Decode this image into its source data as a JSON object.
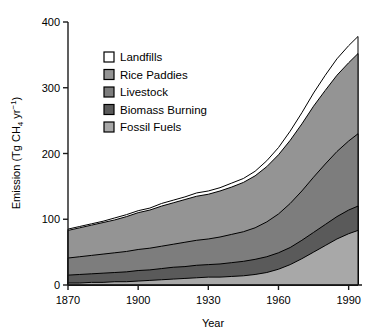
{
  "chart_data": {
    "type": "area",
    "stacked": true,
    "title": "",
    "xlabel": "Year",
    "ylabel": "Emission (Tg CH4 yr-1)",
    "ylabel_display": "Emission (Tg CH₄ yr⁻¹)",
    "xlim": [
      1870,
      1994
    ],
    "ylim": [
      0,
      400
    ],
    "xticks": [
      1870,
      1900,
      1930,
      1960,
      1990
    ],
    "yticks": [
      0,
      100,
      200,
      300,
      400
    ],
    "grid": false,
    "legend_position": "upper-left-inside",
    "x": [
      1870,
      1875,
      1880,
      1885,
      1890,
      1895,
      1900,
      1905,
      1910,
      1915,
      1920,
      1925,
      1930,
      1935,
      1940,
      1945,
      1950,
      1955,
      1960,
      1965,
      1970,
      1975,
      1980,
      1985,
      1990,
      1994
    ],
    "series": [
      {
        "name": "Fossil Fuels",
        "color": "#a8a8a8",
        "values": [
          3,
          3,
          4,
          4,
          5,
          5,
          6,
          7,
          8,
          9,
          10,
          11,
          12,
          12,
          13,
          14,
          16,
          19,
          24,
          31,
          40,
          50,
          60,
          70,
          78,
          83
        ]
      },
      {
        "name": "Biomass Burning",
        "color": "#5a5a5a",
        "values": [
          12,
          13,
          13,
          14,
          14,
          15,
          16,
          16,
          17,
          18,
          18,
          19,
          19,
          20,
          21,
          22,
          23,
          24,
          25,
          26,
          28,
          30,
          32,
          34,
          36,
          37
        ]
      },
      {
        "name": "Livestock",
        "color": "#7d7d7d",
        "values": [
          26,
          27,
          28,
          29,
          30,
          31,
          32,
          33,
          34,
          35,
          37,
          38,
          39,
          41,
          43,
          45,
          48,
          53,
          59,
          67,
          75,
          84,
          92,
          99,
          105,
          110
        ]
      },
      {
        "name": "Rice Paddies",
        "color": "#949494",
        "values": [
          42,
          44,
          46,
          48,
          50,
          53,
          56,
          58,
          61,
          63,
          65,
          67,
          68,
          70,
          72,
          75,
          79,
          84,
          90,
          96,
          102,
          108,
          112,
          116,
          119,
          122
        ]
      },
      {
        "name": "Landfills",
        "color": "#ffffff",
        "values": [
          2,
          2,
          2,
          2,
          3,
          3,
          3,
          3,
          4,
          4,
          4,
          5,
          5,
          5,
          6,
          6,
          7,
          9,
          11,
          14,
          17,
          20,
          23,
          25,
          26,
          26
        ]
      }
    ],
    "legend_order": [
      "Landfills",
      "Rice Paddies",
      "Livestock",
      "Biomass Burning",
      "Fossil Fuels"
    ],
    "legend_swatches": {
      "Landfills": "#ffffff",
      "Rice Paddies": "#949494",
      "Livestock": "#7d7d7d",
      "Biomass Burning": "#5a5a5a",
      "Fossil Fuels": "#a8a8a8"
    }
  },
  "axes": {
    "x_title": "Year",
    "y_title": "Emission (Tg CH₄ yr⁻¹)",
    "xtick_labels": [
      "1870",
      "1900",
      "1930",
      "1960",
      "1990"
    ],
    "ytick_labels": [
      "0",
      "100",
      "200",
      "300",
      "400"
    ]
  },
  "legend": {
    "items": [
      {
        "label": "Landfills"
      },
      {
        "label": "Rice Paddies"
      },
      {
        "label": "Livestock"
      },
      {
        "label": "Biomass Burning"
      },
      {
        "label": "Fossil Fuels"
      }
    ]
  },
  "style": {
    "axis_color": "#1a1a1a",
    "outline_color": "#000000",
    "background": "#ffffff"
  }
}
